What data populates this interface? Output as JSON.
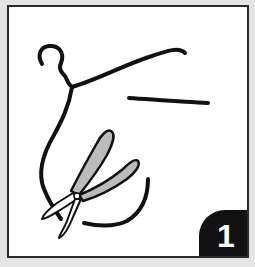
{
  "illustration": {
    "step_number": "1",
    "subject": "wire hanger cut with pliers",
    "colors": {
      "background": "#e4e4e4",
      "panel": "#ffffff",
      "ink": "#111111"
    }
  }
}
